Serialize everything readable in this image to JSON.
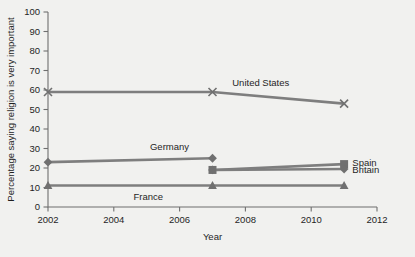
{
  "chart_data": {
    "type": "line",
    "title": "",
    "xlabel": "Year",
    "ylabel": "Percentage saying religion is very important",
    "xlim": [
      2002,
      2012
    ],
    "ylim": [
      0,
      100
    ],
    "xticks": [
      2002,
      2004,
      2006,
      2008,
      2010,
      2012
    ],
    "yticks": [
      0,
      10,
      20,
      30,
      40,
      50,
      60,
      70,
      80,
      90,
      100
    ],
    "grid": false,
    "legend_position": "inline-labels",
    "line_color": "#7e7e7e",
    "marker_color": "#707070",
    "background_color": "#f1f1ef",
    "series": [
      {
        "name": "United States",
        "marker": "x",
        "x": [
          2002,
          2007,
          2011
        ],
        "values": [
          59,
          59,
          53
        ],
        "label": "United States",
        "label_x": 2007.6,
        "label_y": 64
      },
      {
        "name": "Germany",
        "marker": "diamond",
        "x": [
          2002,
          2007
        ],
        "values": [
          23,
          25
        ],
        "label": "Germany",
        "label_x": 2005.1,
        "label_y": 31
      },
      {
        "name": "Spain",
        "marker": "square",
        "x": [
          2007,
          2011
        ],
        "values": [
          19,
          22
        ],
        "label": "Spain",
        "label_x": 2011.25,
        "label_y": 23
      },
      {
        "name": "Britain",
        "marker": "diamond",
        "x": [
          2007,
          2011
        ],
        "values": [
          19,
          19.5
        ],
        "label": "Britain",
        "label_x": 2011.25,
        "label_y": 19
      },
      {
        "name": "France",
        "marker": "triangle",
        "x": [
          2002,
          2007,
          2011
        ],
        "values": [
          11,
          11,
          11
        ],
        "label": "France",
        "label_x": 2004.6,
        "label_y": 5.5
      }
    ]
  }
}
